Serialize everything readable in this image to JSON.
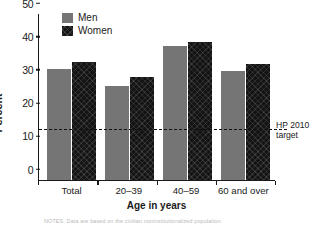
{
  "chart_data": {
    "type": "bar",
    "title": "",
    "xlabel": "Age in years",
    "ylabel": "Percent",
    "categories": [
      "Total",
      "20–39",
      "40–59",
      "60 and over"
    ],
    "series": [
      {
        "name": "Men",
        "color": "#757575",
        "values": [
          33.3,
          28.1,
          40.1,
          32.7
        ]
      },
      {
        "name": "Women",
        "color": "#141414",
        "values": [
          35.3,
          30.8,
          41.4,
          34.8
        ]
      }
    ],
    "ylim": [
      0,
      50
    ],
    "yticks": [
      0,
      10,
      20,
      30,
      40,
      50
    ],
    "ytick_labels": [
      "0",
      "10",
      "20",
      "30",
      "40",
      "50"
    ],
    "grid": false,
    "legend_position": "top-left",
    "annotations": [
      {
        "name": "hp-2010-target",
        "type": "hline",
        "value": 15,
        "label_line1": "HP 2010",
        "label_line2": "target",
        "style": "dashed"
      }
    ]
  },
  "legend": {
    "items": [
      {
        "label": "Men",
        "swatch": "men-swatch"
      },
      {
        "label": "Women",
        "swatch": "women-swatch"
      }
    ]
  },
  "footnote": {
    "text": "NOTES: Data are based on the civilian noninstitutionalized population."
  }
}
